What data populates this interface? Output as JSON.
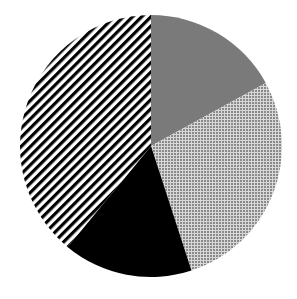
{
  "chart_data": {
    "type": "pie",
    "title": "",
    "legend": [],
    "start_angle_deg": 0,
    "direction": "clockwise",
    "slices": [
      {
        "label": "",
        "value": 17,
        "fill": "solid",
        "color": "#7a7a7a"
      },
      {
        "label": "",
        "value": 28,
        "fill": "dotted",
        "color": "#8a8a8a"
      },
      {
        "label": "",
        "value": 16,
        "fill": "solid",
        "color": "#000000"
      },
      {
        "label": "",
        "value": 39,
        "fill": "diagonal-stripes",
        "color": "#000000"
      }
    ],
    "center": [
      151,
      146
    ],
    "radius": 131
  }
}
